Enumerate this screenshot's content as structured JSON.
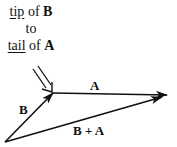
{
  "caption": {
    "line1": {
      "underlined": "tip",
      "plain": " of ",
      "bold": "B"
    },
    "line2": {
      "plain": "to"
    },
    "line3": {
      "underlined": "tail",
      "plain": " of ",
      "bold": "A"
    }
  },
  "vectors": [
    {
      "name": "B",
      "label": "B",
      "from": [
        5,
        142
      ],
      "to": [
        53,
        93
      ]
    },
    {
      "name": "A",
      "label": "A",
      "from": [
        53,
        93
      ],
      "to": [
        167,
        95
      ]
    },
    {
      "name": "B + A",
      "label": "B + A",
      "from": [
        5,
        142
      ],
      "to": [
        162,
        97
      ]
    }
  ],
  "pointer_arrow": {
    "from": [
      36,
      68
    ],
    "to": [
      52,
      91
    ],
    "style": "double-line"
  },
  "colors": {
    "ink": "#111111",
    "background": "#ffffff"
  }
}
